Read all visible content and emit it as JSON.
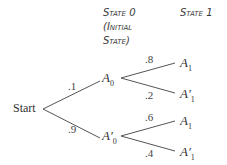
{
  "headers": {
    "state0_line1": "State 0",
    "state0_line2": "(Initial",
    "state0_line3": "State)",
    "state1": "State 1"
  },
  "root": "Start",
  "level1": [
    {
      "node": "A",
      "sub": "0",
      "prime": "",
      "prob": ".1"
    },
    {
      "node": "A",
      "sub": "0",
      "prime": "′",
      "prob": ".9"
    }
  ],
  "level2": [
    {
      "node": "A",
      "sub": "1",
      "prime": "",
      "prob": ".8"
    },
    {
      "node": "A",
      "sub": "1",
      "prime": "′",
      "prob": ".2"
    },
    {
      "node": "A",
      "sub": "1",
      "prime": "",
      "prob": ".6"
    },
    {
      "node": "A",
      "sub": "1",
      "prime": "′",
      "prob": ".4"
    }
  ]
}
